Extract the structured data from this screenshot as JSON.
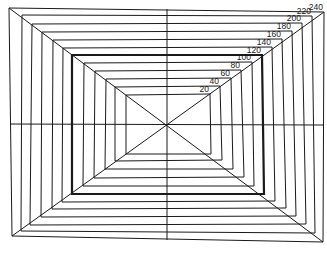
{
  "diagram": {
    "type": "nested-rectangles",
    "center": [
      167,
      124
    ],
    "line_color": "#1a1a1a",
    "background": "#ffffff",
    "emphasized_level": 120,
    "levels": [
      {
        "label": "20",
        "tl": [
          126,
          95
        ],
        "tr": [
          210,
          94
        ],
        "br": [
          211,
          154
        ],
        "bl": [
          126,
          154
        ]
      },
      {
        "label": "40",
        "tl": [
          115,
          87
        ],
        "tr": [
          220,
          86
        ],
        "br": [
          222,
          160
        ],
        "bl": [
          115,
          161
        ]
      },
      {
        "label": "60",
        "tl": [
          106,
          79
        ],
        "tr": [
          231,
          78
        ],
        "br": [
          233,
          169
        ],
        "bl": [
          105,
          169
        ]
      },
      {
        "label": "80",
        "tl": [
          95,
          71
        ],
        "tr": [
          241,
          70
        ],
        "br": [
          244,
          177
        ],
        "bl": [
          94,
          178
        ]
      },
      {
        "label": "100",
        "tl": [
          84,
          63
        ],
        "tr": [
          252,
          62
        ],
        "br": [
          254,
          186
        ],
        "bl": [
          83,
          186
        ]
      },
      {
        "label": "120",
        "tl": [
          72,
          55
        ],
        "tr": [
          262,
          55
        ],
        "br": [
          264,
          194
        ],
        "bl": [
          72,
          194
        ]
      },
      {
        "label": "140",
        "tl": [
          63,
          48
        ],
        "tr": [
          272,
          47
        ],
        "br": [
          275,
          201
        ],
        "bl": [
          62,
          202
        ]
      },
      {
        "label": "160",
        "tl": [
          53,
          40
        ],
        "tr": [
          282,
          39
        ],
        "br": [
          286,
          208
        ],
        "bl": [
          52,
          209
        ]
      },
      {
        "label": "180",
        "tl": [
          42,
          32
        ],
        "tr": [
          292,
          31
        ],
        "br": [
          296,
          216
        ],
        "bl": [
          41,
          217
        ]
      },
      {
        "label": "200",
        "tl": [
          32,
          24
        ],
        "tr": [
          302,
          23
        ],
        "br": [
          306,
          224
        ],
        "bl": [
          30,
          225
        ]
      },
      {
        "label": "220",
        "tl": [
          22,
          15
        ],
        "tr": [
          312,
          16
        ],
        "br": [
          315,
          233
        ],
        "bl": [
          21,
          231
        ]
      },
      {
        "label": "240",
        "tl": [
          9,
          8
        ],
        "tr": [
          324,
          12
        ],
        "br": [
          323,
          242
        ],
        "bl": [
          12,
          236
        ]
      }
    ],
    "crosshair": {
      "horizontal": {
        "x1": 10,
        "y1": 124,
        "x2": 324,
        "y2": 125
      },
      "vertical": {
        "x1": 167,
        "y1": 9,
        "x2": 167,
        "y2": 240
      }
    }
  }
}
